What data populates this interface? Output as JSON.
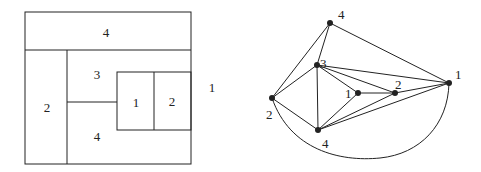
{
  "left_figure": {
    "regions": [
      {
        "id": "top",
        "label": "4"
      },
      {
        "id": "left",
        "label": "2"
      },
      {
        "id": "mid-upper",
        "label": "3"
      },
      {
        "id": "mid-lower",
        "label": "4"
      },
      {
        "id": "inner-left",
        "label": "1"
      },
      {
        "id": "inner-right",
        "label": "2"
      },
      {
        "id": "outside",
        "label": "1"
      }
    ]
  },
  "right_figure": {
    "nodes": [
      {
        "id": "n-top",
        "label": "4"
      },
      {
        "id": "n-3",
        "label": "3"
      },
      {
        "id": "n-left",
        "label": "2"
      },
      {
        "id": "n-bottom",
        "label": "4"
      },
      {
        "id": "n-inner1",
        "label": "1"
      },
      {
        "id": "n-inner2",
        "label": "2"
      },
      {
        "id": "n-right",
        "label": "1"
      }
    ]
  },
  "colors": {
    "stroke": "#222222",
    "background": "#ffffff"
  }
}
